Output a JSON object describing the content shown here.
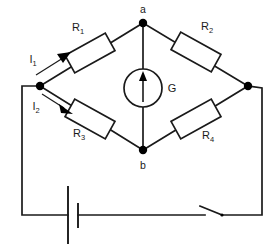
{
  "figure": {
    "background_color": "#ffffff",
    "line_color": "#1a1a1a",
    "width": 278,
    "height": 247
  },
  "nodes": [
    {
      "id": "a",
      "label": "a",
      "x": 143,
      "y": 23,
      "label_x": 143,
      "label_y": 12
    },
    {
      "id": "b",
      "label": "b",
      "x": 143,
      "y": 150,
      "label_x": 143,
      "label_y": 168
    },
    {
      "id": "left",
      "label": "",
      "x": 40,
      "y": 86
    },
    {
      "id": "right",
      "label": "",
      "x": 248,
      "y": 86
    }
  ],
  "resistors": [
    {
      "id": "R1",
      "label": "R",
      "subscript": "1",
      "label_x": 78,
      "label_y": 31,
      "cx": 90,
      "cy": 53,
      "angle": -29,
      "w": 46,
      "h": 20
    },
    {
      "id": "R2",
      "label": "R",
      "subscript": "2",
      "label_x": 207,
      "label_y": 30,
      "cx": 196,
      "cy": 52,
      "angle": 29,
      "w": 46,
      "h": 20
    },
    {
      "id": "R3",
      "label": "R",
      "subscript": "3",
      "label_x": 79,
      "label_y": 137,
      "cx": 90,
      "cy": 119,
      "angle": 29,
      "w": 46,
      "h": 20
    },
    {
      "id": "R4",
      "label": "R",
      "subscript": "4",
      "label_x": 208,
      "label_y": 139,
      "cx": 196,
      "cy": 119,
      "angle": -29,
      "w": 46,
      "h": 20
    }
  ],
  "meter": {
    "id": "G",
    "label": "G",
    "label_x": 172,
    "label_y": 91,
    "cx": 143,
    "cy": 88,
    "r": 19,
    "needle_direction": "up"
  },
  "currents": [
    {
      "id": "I1",
      "label": "I",
      "subscript": "1",
      "label_x": 36,
      "label_y": 62,
      "direction": "up-right"
    },
    {
      "id": "I2",
      "label": "I",
      "subscript": "2",
      "label_x": 39,
      "label_y": 107,
      "direction": "down-right"
    }
  ],
  "source": {
    "id": "battery",
    "type": "battery",
    "long_plate_x": 68,
    "short_plate_x": 78,
    "wire_y": 215
  },
  "switch": {
    "id": "switch",
    "state": "open",
    "pivot_x": 222,
    "pivot_y": 215,
    "blade_tip_x": 200,
    "blade_tip_y": 206
  }
}
